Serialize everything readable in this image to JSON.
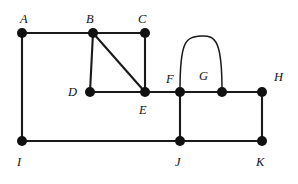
{
  "figure": {
    "type": "graph-diagram",
    "background_color": "#ffffff",
    "edge_color": "#1a1a1a",
    "vertex_color": "#111111",
    "label_color": "#111111",
    "edge_width": 2.1,
    "curved_edge_width": 1.5,
    "vertex_radius": 5.0,
    "width": 298,
    "height": 184
  },
  "vertices": [
    {
      "id": "A",
      "label": "A",
      "x": 22,
      "y": 33,
      "label_x": 20,
      "label_y": 13
    },
    {
      "id": "B",
      "label": "B",
      "x": 93,
      "y": 33,
      "label_x": 86,
      "label_y": 13
    },
    {
      "id": "C",
      "label": "C",
      "x": 145,
      "y": 33,
      "label_x": 138,
      "label_y": 13
    },
    {
      "id": "D",
      "label": "D",
      "x": 90,
      "y": 92,
      "label_x": 68,
      "label_y": 86
    },
    {
      "id": "E",
      "label": "E",
      "x": 145,
      "y": 92,
      "label_x": 139,
      "label_y": 104
    },
    {
      "id": "F",
      "label": "F",
      "x": 180,
      "y": 92,
      "label_x": 166,
      "label_y": 73
    },
    {
      "id": "G",
      "label": "G",
      "x": 222,
      "y": 92,
      "label_x": 199,
      "label_y": 70
    },
    {
      "id": "H",
      "label": "H",
      "x": 262,
      "y": 92,
      "label_x": 274,
      "label_y": 71
    },
    {
      "id": "I",
      "label": "I",
      "x": 22,
      "y": 141,
      "label_x": 17,
      "label_y": 156
    },
    {
      "id": "J",
      "label": "J",
      "x": 180,
      "y": 141,
      "label_x": 175,
      "label_y": 156
    },
    {
      "id": "K",
      "label": "K",
      "x": 262,
      "y": 141,
      "label_x": 256,
      "label_y": 156
    }
  ],
  "edges": [
    {
      "from": "A",
      "to": "B",
      "shape": "straight"
    },
    {
      "from": "B",
      "to": "C",
      "shape": "straight"
    },
    {
      "from": "A",
      "to": "I",
      "shape": "straight"
    },
    {
      "from": "B",
      "to": "D",
      "shape": "straight"
    },
    {
      "from": "B",
      "to": "E",
      "shape": "straight"
    },
    {
      "from": "C",
      "to": "E",
      "shape": "straight"
    },
    {
      "from": "D",
      "to": "E",
      "shape": "straight"
    },
    {
      "from": "E",
      "to": "F",
      "shape": "straight"
    },
    {
      "from": "F",
      "to": "G",
      "shape": "arc-above"
    },
    {
      "from": "F",
      "to": "G",
      "shape": "straight"
    },
    {
      "from": "G",
      "to": "H",
      "shape": "straight"
    },
    {
      "from": "F",
      "to": "J",
      "shape": "straight"
    },
    {
      "from": "I",
      "to": "J",
      "shape": "straight"
    },
    {
      "from": "J",
      "to": "K",
      "shape": "straight"
    },
    {
      "from": "H",
      "to": "K",
      "shape": "straight"
    }
  ],
  "arcs": [
    {
      "from": "F",
      "to": "G",
      "path": "M 180 90 C 180 40, 186 37, 201 36 C 216 35, 222 42, 222 90",
      "apex_y": 36
    }
  ]
}
